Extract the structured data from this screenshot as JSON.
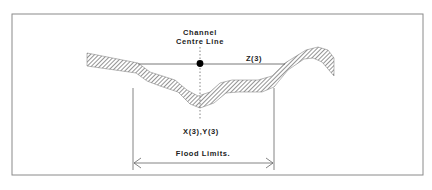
{
  "diagram": {
    "cut_off_header_text": "",
    "labels": {
      "channel": "Channel",
      "centre_line": "Centre Line",
      "z": "Z(3)",
      "xy": "X(3),Y(3)",
      "flood_limits": "Flood Limits."
    },
    "colors": {
      "line": "#555555",
      "hatch": "#777777",
      "dot": "#000000",
      "frame": "#888888"
    }
  }
}
